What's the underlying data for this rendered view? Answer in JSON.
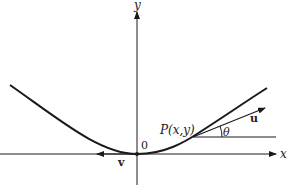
{
  "diagram": {
    "colors": {
      "ink": "#1a1a1a",
      "background": "#ffffff"
    },
    "labels": {
      "x_axis": "x",
      "y_axis": "y",
      "origin": "0",
      "point": "P(x,y)",
      "tangent_vector": "u",
      "angle": "θ",
      "origin_vector": "v"
    }
  }
}
